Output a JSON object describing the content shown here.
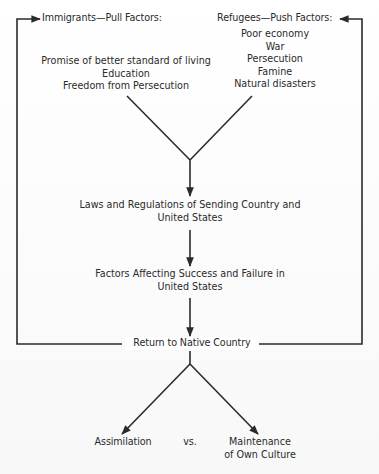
{
  "diagram": {
    "pull_header": "Immigrants—Pull Factors:",
    "push_header": "Refugees—Push Factors:",
    "pull_factors": [
      "Promise of better standard of living",
      "Education",
      "Freedom from Persecution"
    ],
    "push_factors": [
      "Poor economy",
      "War",
      "Persecution",
      "Famine",
      "Natural disasters"
    ],
    "laws_box": {
      "line1": "Laws and Regulations of Sending Country and",
      "line2": "United States"
    },
    "factors_box": {
      "line1": "Factors Affecting Success and Failure in",
      "line2": "United States"
    },
    "return_label": "Return to Native Country",
    "outcomes": {
      "left": "Assimilation",
      "versus": "vs.",
      "right_line1": "Maintenance",
      "right_line2": "of Own Culture"
    },
    "colors": {
      "line": "#2b2b2b",
      "text": "#2a2a2a",
      "background": "#ffffff"
    }
  }
}
